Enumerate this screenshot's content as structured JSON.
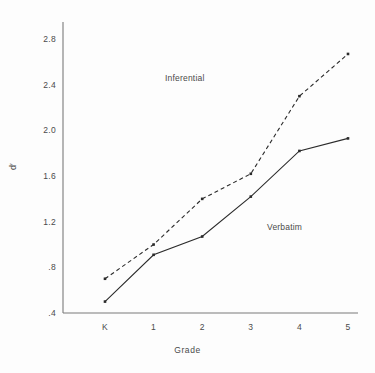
{
  "chart_data": {
    "type": "line",
    "title": "",
    "xlabel": "Grade",
    "ylabel": "d′",
    "categories": [
      "K",
      "1",
      "2",
      "3",
      "4",
      "5"
    ],
    "yticks": [
      ".4",
      ".8",
      "1.2",
      "1.6",
      "2.0",
      "2.4",
      "2.8"
    ],
    "ytick_values": [
      0.4,
      0.8,
      1.2,
      1.6,
      2.0,
      2.4,
      2.8
    ],
    "ylim": [
      0.4,
      2.95
    ],
    "xlim_categories": [
      "K",
      "5"
    ],
    "grid": false,
    "legend": "inline-annotations",
    "series": [
      {
        "name": "Inferential",
        "style": "dashed",
        "color": "#2b2b2b",
        "values": [
          0.7,
          1.0,
          1.4,
          1.62,
          2.3,
          2.67
        ]
      },
      {
        "name": "Verbatim",
        "style": "solid",
        "color": "#2b2b2b",
        "values": [
          0.5,
          0.91,
          1.07,
          1.42,
          1.82,
          1.93
        ]
      }
    ],
    "annotations": [
      {
        "text": "Inferential",
        "series": "Inferential"
      },
      {
        "text": "Verbatim",
        "series": "Verbatim"
      }
    ]
  },
  "axes": {
    "y_title": "d′",
    "x_title": "Grade"
  }
}
